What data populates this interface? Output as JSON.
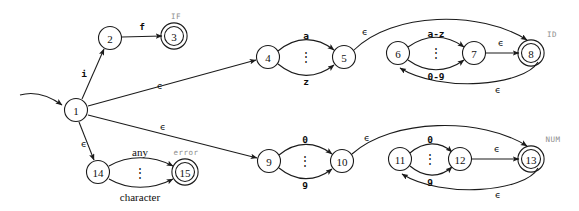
{
  "diagram": {
    "background_color": "#ffffff",
    "stroke_color": "#1b1b1b",
    "tag_color": "#8e8e8e",
    "epsilon": "ϵ",
    "vertical_dots": "⋮"
  },
  "states": [
    {
      "id": "1",
      "label": "1",
      "cx": 76,
      "cy": 110,
      "r": 11.5,
      "accepting": false,
      "tag": ""
    },
    {
      "id": "2",
      "label": "2",
      "cx": 110,
      "cy": 38,
      "r": 11.5,
      "accepting": false,
      "tag": ""
    },
    {
      "id": "3",
      "label": "3",
      "cx": 174,
      "cy": 36,
      "r": 9.5,
      "accepting": true,
      "tag": "IF"
    },
    {
      "id": "4",
      "label": "4",
      "cx": 268,
      "cy": 57,
      "r": 11.5,
      "accepting": false,
      "tag": ""
    },
    {
      "id": "5",
      "label": "5",
      "cx": 344,
      "cy": 57,
      "r": 11.5,
      "accepting": false,
      "tag": ""
    },
    {
      "id": "6",
      "label": "6",
      "cx": 398,
      "cy": 53,
      "r": 11.5,
      "accepting": false,
      "tag": ""
    },
    {
      "id": "7",
      "label": "7",
      "cx": 474,
      "cy": 53,
      "r": 11.5,
      "accepting": false,
      "tag": ""
    },
    {
      "id": "8",
      "label": "8",
      "cx": 531,
      "cy": 53,
      "r": 9.5,
      "accepting": true,
      "tag": "ID"
    },
    {
      "id": "9",
      "label": "9",
      "cx": 269,
      "cy": 161,
      "r": 11.5,
      "accepting": false,
      "tag": ""
    },
    {
      "id": "10",
      "label": "10",
      "cx": 342,
      "cy": 161,
      "r": 11.5,
      "accepting": false,
      "tag": ""
    },
    {
      "id": "11",
      "label": "11",
      "cx": 400,
      "cy": 159,
      "r": 11.5,
      "accepting": false,
      "tag": ""
    },
    {
      "id": "12",
      "label": "12",
      "cx": 460,
      "cy": 159,
      "r": 11.5,
      "accepting": false,
      "tag": ""
    },
    {
      "id": "13",
      "label": "13",
      "cx": 531,
      "cy": 159,
      "r": 9.5,
      "accepting": true,
      "tag": "NUM"
    },
    {
      "id": "14",
      "label": "14",
      "cx": 98,
      "cy": 172,
      "r": 11.5,
      "accepting": false,
      "tag": ""
    },
    {
      "id": "15",
      "label": "15",
      "cx": 185,
      "cy": 172,
      "r": 9.5,
      "accepting": true,
      "tag": "error"
    }
  ],
  "start": {
    "target_state": "1",
    "arrow_path": "M 20,95 C 34,91 48,95 62,105"
  },
  "transitions": [
    {
      "id": "t1_2",
      "from": "1",
      "to": "2",
      "label": "i",
      "label_style": "bold-mono",
      "lx": 84,
      "ly": 73,
      "path": "M 82,99 L 104,49"
    },
    {
      "id": "t2_3",
      "from": "2",
      "to": "3",
      "label": "f",
      "label_style": "bold-mono",
      "lx": 142,
      "ly": 26,
      "path": "M 122,37 L 162,36"
    },
    {
      "id": "t1_4",
      "from": "1",
      "to": "4",
      "label": "ϵ",
      "label_style": "epsilon",
      "lx": 160,
      "ly": 85,
      "path": "M 88,106 L 256,60"
    },
    {
      "id": "t4_5_a",
      "from": "4",
      "to": "5",
      "label": "a",
      "label_style": "bold-mono",
      "lx": 306,
      "ly": 35,
      "path": "M 278,51 C 296,36 316,36 334,50"
    },
    {
      "id": "t4_5_z",
      "from": "4",
      "to": "5",
      "label": "z",
      "label_style": "bold-mono",
      "lx": 306,
      "ly": 81,
      "path": "M 278,64 C 296,79 316,79 334,65"
    },
    {
      "id": "t4_5_dots",
      "from": "4",
      "to": "5",
      "label": "⋮",
      "label_style": "dots",
      "lx": 306,
      "ly": 57,
      "path": ""
    },
    {
      "id": "t5_8",
      "from": "5",
      "to": "8",
      "label": "ϵ",
      "label_style": "epsilon",
      "lx": 365,
      "ly": 31,
      "path": "M 354,50 C 392,12 480,10 527,40"
    },
    {
      "id": "t6_7_az",
      "from": "6",
      "to": "7",
      "label": "a-z",
      "label_style": "bold-mono",
      "lx": 436,
      "ly": 33,
      "path": "M 408,47 C 426,34 446,34 464,47"
    },
    {
      "id": "t6_7_09",
      "from": "6",
      "to": "7",
      "label": "0-9",
      "label_style": "bold-mono",
      "lx": 436,
      "ly": 76,
      "path": "M 408,60 C 426,73 446,73 464,60"
    },
    {
      "id": "t6_7_dots",
      "from": "6",
      "to": "7",
      "label": "⋮",
      "label_style": "dots",
      "lx": 436,
      "ly": 53,
      "path": ""
    },
    {
      "id": "t7_8",
      "from": "7",
      "to": "8",
      "label": "ϵ",
      "label_style": "epsilon",
      "lx": 501,
      "ly": 42,
      "path": "M 486,53 L 519,53"
    },
    {
      "id": "t8_6",
      "from": "8",
      "to": "6",
      "label": "ϵ",
      "label_style": "epsilon",
      "lx": 498,
      "ly": 89,
      "path": "M 538,62 C 524,86 440,93 400,68"
    },
    {
      "id": "t1_9",
      "from": "1",
      "to": "9",
      "label": "ϵ",
      "label_style": "epsilon",
      "lx": 163,
      "ly": 126,
      "path": "M 88,115 L 257,158"
    },
    {
      "id": "t9_10_0",
      "from": "9",
      "to": "10",
      "label": "0",
      "label_style": "bold-mono",
      "lx": 305,
      "ly": 139,
      "path": "M 279,155 C 296,141 315,141 332,154"
    },
    {
      "id": "t9_10_9",
      "from": "9",
      "to": "10",
      "label": "9",
      "label_style": "bold-mono",
      "lx": 305,
      "ly": 185,
      "path": "M 279,168 C 296,182 315,182 332,169"
    },
    {
      "id": "t9_10_dots",
      "from": "9",
      "to": "10",
      "label": "⋮",
      "label_style": "dots",
      "lx": 305,
      "ly": 161,
      "path": ""
    },
    {
      "id": "t10_13",
      "from": "10",
      "to": "13",
      "label": "ϵ",
      "label_style": "epsilon",
      "lx": 367,
      "ly": 137,
      "path": "M 352,154 C 392,118 482,117 527,146"
    },
    {
      "id": "t11_12_0",
      "from": "11",
      "to": "12",
      "label": "0",
      "label_style": "bold-mono",
      "lx": 430,
      "ly": 139,
      "path": "M 410,153 C 424,141 440,141 452,152"
    },
    {
      "id": "t11_12_9",
      "from": "11",
      "to": "12",
      "label": "9",
      "label_style": "bold-mono",
      "lx": 430,
      "ly": 182,
      "path": "M 410,166 C 424,178 440,178 452,167"
    },
    {
      "id": "t11_12_dots",
      "from": "11",
      "to": "12",
      "label": "⋮",
      "label_style": "dots",
      "lx": 430,
      "ly": 159,
      "path": ""
    },
    {
      "id": "t12_13",
      "from": "12",
      "to": "13",
      "label": "ϵ",
      "label_style": "epsilon",
      "lx": 497,
      "ly": 148,
      "path": "M 472,159 L 519,159"
    },
    {
      "id": "t13_11",
      "from": "13",
      "to": "11",
      "label": "ϵ",
      "label_style": "epsilon",
      "lx": 498,
      "ly": 194,
      "path": "M 538,168 C 526,192 442,199 402,174"
    },
    {
      "id": "t1_14",
      "from": "1",
      "to": "14",
      "label": "ϵ",
      "label_style": "epsilon",
      "lx": 84,
      "ly": 143,
      "path": "M 79,122 L 94,160"
    },
    {
      "id": "t14_15_any",
      "from": "14",
      "to": "15",
      "label": "any",
      "label_style": "serif",
      "lx": 140,
      "ly": 152,
      "path": "M 109,166 C 128,155 152,155 173,166"
    },
    {
      "id": "t14_15_char",
      "from": "14",
      "to": "15",
      "label": "character",
      "label_style": "serif",
      "lx": 140,
      "ly": 197,
      "path": "M 109,179 C 128,190 152,190 173,179"
    },
    {
      "id": "t14_15_dots",
      "from": "14",
      "to": "15",
      "label": "⋮",
      "label_style": "dots",
      "lx": 140,
      "ly": 173,
      "path": ""
    }
  ],
  "accept_tags": [
    {
      "state": "3",
      "text": "IF",
      "x": 176,
      "y": 16
    },
    {
      "state": "8",
      "text": "ID",
      "x": 552,
      "y": 34
    },
    {
      "state": "13",
      "text": "NUM",
      "x": 553,
      "y": 139
    },
    {
      "state": "15",
      "text": "error",
      "x": 186,
      "y": 152
    }
  ]
}
